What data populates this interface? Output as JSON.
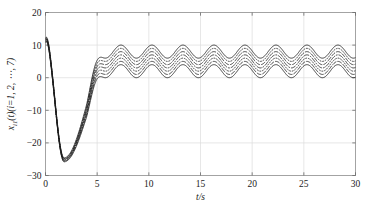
{
  "figure": {
    "background_color": "#ffffff",
    "line_color": "#1c1c1c",
    "grid_color": "#dcdcdc",
    "frame_color": "#9a9a9a"
  },
  "axis": {
    "xlabel": "t/s",
    "ylabel_main": "x",
    "ylabel_sub": "i1",
    "ylabel_rest": "(t)(i=1, 2, ⋯, 7)",
    "xticklabels": [
      "0",
      "5",
      "10",
      "15",
      "20",
      "25",
      "30"
    ],
    "yticklabels": [
      "-30",
      "-20",
      "-10",
      "0",
      "10",
      "20"
    ]
  },
  "chart_data": {
    "type": "line",
    "title": "",
    "xlabel": "t/s",
    "ylabel": "x_i1(t)(i=1, 2, ⋯, 7)",
    "xlim": [
      0,
      30
    ],
    "ylim": [
      -30,
      20
    ],
    "xticks": [
      0,
      5,
      10,
      15,
      20,
      25,
      30
    ],
    "yticks": [
      -30,
      -20,
      -10,
      0,
      10,
      20
    ],
    "grid": true,
    "legend": "none",
    "n_series": 7,
    "series_names": [
      "x_11",
      "x_21",
      "x_31",
      "x_41",
      "x_51",
      "x_61",
      "x_71"
    ],
    "series_styles": [
      "solid",
      "dashed",
      "dotted",
      "dash-dot",
      "dashed",
      "dotted",
      "solid"
    ],
    "transient": {
      "t_start": 0,
      "y_start_range": [
        10.8,
        12.2
      ],
      "t_min": 1.8,
      "y_min_range": [
        -25.8,
        -24.6
      ],
      "t_settle": 6.0
    },
    "steady_state": {
      "period_s": 3.0,
      "amplitude": 2.0,
      "offsets": [
        2.0,
        3.0,
        4.0,
        5.0,
        6.0,
        7.0,
        8.0
      ],
      "mean_center": 5.0,
      "band_low": 0.5,
      "band_high": 9.5
    },
    "series": [
      {
        "name": "x_11",
        "style": "solid",
        "offset": 2.0
      },
      {
        "name": "x_21",
        "style": "dashed",
        "offset": 3.0
      },
      {
        "name": "x_31",
        "style": "dotted",
        "offset": 4.0
      },
      {
        "name": "x_41",
        "style": "dash-dot",
        "offset": 5.0
      },
      {
        "name": "x_51",
        "style": "dashed",
        "offset": 6.0
      },
      {
        "name": "x_61",
        "style": "dotted",
        "offset": 7.0
      },
      {
        "name": "x_71",
        "style": "solid",
        "offset": 8.0
      }
    ]
  }
}
